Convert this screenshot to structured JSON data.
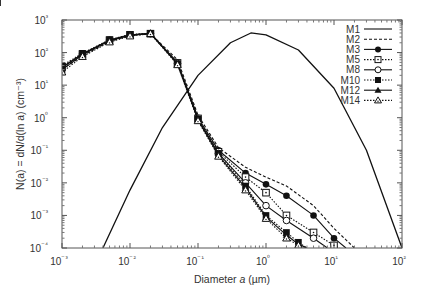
{
  "chart_data": {
    "type": "line",
    "title": "",
    "xlabel": "Diameter a (µm)",
    "ylabel": "N(a) = dN/d(ln a) (cm⁻³)",
    "xscale": "log",
    "yscale": "log",
    "xlim": [
      0.001,
      100
    ],
    "ylim": [
      0.0001,
      1000
    ],
    "grid": false,
    "legend_position": "upper right (inside)",
    "x_tick_labels": [
      "10⁻³",
      "10⁻²",
      "10⁻¹",
      "10⁰",
      "10¹",
      "10²"
    ],
    "y_tick_labels": [
      "10³",
      "10²",
      "10¹",
      "10⁰",
      "10⁻¹",
      "10⁻²",
      "10⁻³",
      "10⁻⁴"
    ],
    "series": [
      {
        "name": "M1",
        "style": "solid",
        "marker": "none",
        "x": [
          0.004,
          0.01,
          0.03,
          0.1,
          0.3,
          0.6,
          1,
          3,
          10,
          30,
          100
        ],
        "y": [
          0.0001,
          0.006,
          0.5,
          20,
          200,
          400,
          350,
          120,
          8,
          0.1,
          0.0001
        ]
      },
      {
        "name": "M2",
        "style": "dashed",
        "marker": "none",
        "x": [
          0.001,
          0.002,
          0.005,
          0.01,
          0.02,
          0.05,
          0.1,
          0.2,
          0.5,
          1,
          2,
          5,
          10,
          20
        ],
        "y": [
          30,
          80,
          220,
          330,
          380,
          60,
          1.2,
          0.12,
          0.03,
          0.015,
          0.008,
          0.002,
          0.0004,
          0.0001
        ]
      },
      {
        "name": "M3",
        "style": "solid",
        "marker": "filled-circle",
        "x": [
          0.001,
          0.002,
          0.005,
          0.01,
          0.02,
          0.05,
          0.1,
          0.2,
          0.5,
          1,
          2,
          5,
          10,
          15
        ],
        "y": [
          35,
          90,
          240,
          350,
          380,
          50,
          1.0,
          0.1,
          0.02,
          0.009,
          0.004,
          0.001,
          0.0002,
          0.0001
        ]
      },
      {
        "name": "M5",
        "style": "dotted",
        "marker": "open-square-dot",
        "x": [
          0.001,
          0.002,
          0.005,
          0.01,
          0.02,
          0.05,
          0.1,
          0.2,
          0.5,
          1,
          2,
          5,
          10,
          12
        ],
        "y": [
          35,
          90,
          240,
          350,
          380,
          48,
          0.95,
          0.09,
          0.015,
          0.005,
          0.001,
          0.0003,
          0.00012,
          0.0001
        ]
      },
      {
        "name": "M8",
        "style": "solid",
        "marker": "open-circle",
        "x": [
          0.001,
          0.002,
          0.005,
          0.01,
          0.02,
          0.05,
          0.1,
          0.2,
          0.5,
          1,
          2,
          5,
          8
        ],
        "y": [
          35,
          90,
          240,
          350,
          380,
          46,
          0.9,
          0.08,
          0.01,
          0.002,
          0.0007,
          0.0002,
          0.0001
        ]
      },
      {
        "name": "M10",
        "style": "dotted",
        "marker": "filled-square",
        "x": [
          0.001,
          0.002,
          0.005,
          0.01,
          0.02,
          0.05,
          0.1,
          0.2,
          0.5,
          1,
          2,
          3,
          4
        ],
        "y": [
          40,
          95,
          250,
          360,
          390,
          45,
          0.9,
          0.08,
          0.008,
          0.001,
          0.0003,
          0.00015,
          0.0001
        ]
      },
      {
        "name": "M12",
        "style": "solid",
        "marker": "filled-triangle",
        "x": [
          0.001,
          0.002,
          0.005,
          0.01,
          0.02,
          0.05,
          0.1,
          0.2,
          0.5,
          1,
          2,
          3,
          4
        ],
        "y": [
          30,
          85,
          230,
          340,
          400,
          44,
          0.85,
          0.07,
          0.007,
          0.0009,
          0.00025,
          0.00013,
          0.0001
        ]
      },
      {
        "name": "M14",
        "style": "dotted",
        "marker": "open-triangle-dot",
        "x": [
          0.001,
          0.002,
          0.005,
          0.01,
          0.02,
          0.05,
          0.1,
          0.2,
          0.5,
          1,
          2,
          3,
          4
        ],
        "y": [
          25,
          75,
          210,
          320,
          380,
          42,
          0.8,
          0.065,
          0.006,
          0.0008,
          0.0002,
          0.00012,
          0.0001
        ]
      }
    ]
  },
  "axes": {
    "xlabel_main": "Diameter ",
    "xlabel_var": "a",
    "xlabel_unit": " (µm)",
    "ylabel": "N(a) = dN/d(ln a) (cm⁻³)"
  },
  "legend": {
    "entries": [
      "M1",
      "M2",
      "M3",
      "M5",
      "M8",
      "M10",
      "M12",
      "M14"
    ]
  }
}
